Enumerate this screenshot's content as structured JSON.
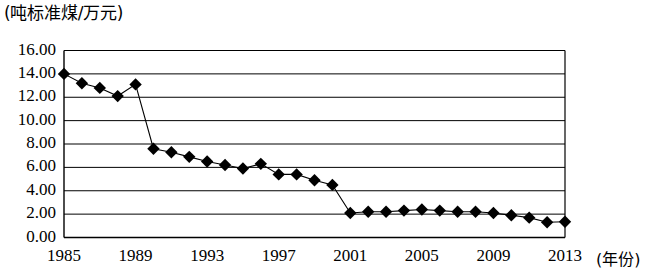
{
  "chart_data": {
    "type": "line",
    "title": "",
    "subtitle": "",
    "ylabel": "(吨标准煤/万元)",
    "xlabel": "(年份)",
    "ylim": [
      0,
      16
    ],
    "ytick_step": 2,
    "grid": true,
    "legend": null,
    "marker": "diamond",
    "marker_color": "#000000",
    "line_color": "#000000",
    "xlim": [
      1985,
      2013
    ],
    "ytick_labels": [
      "16.00",
      "14.00",
      "12.00",
      "10.00",
      "8.00",
      "6.00",
      "4.00",
      "2.00",
      "0.00"
    ],
    "ytick_values": [
      16,
      14,
      12,
      10,
      8,
      6,
      4,
      2,
      0
    ],
    "xtick_labels": [
      "1985",
      "1989",
      "1993",
      "1997",
      "2001",
      "2005",
      "2009",
      "2013"
    ],
    "xtick_values": [
      1985,
      1989,
      1993,
      1997,
      2001,
      2005,
      2009,
      2013
    ],
    "x": [
      1985,
      1986,
      1987,
      1988,
      1989,
      1990,
      1991,
      1992,
      1993,
      1994,
      1995,
      1996,
      1997,
      1998,
      1999,
      2000,
      2001,
      2002,
      2003,
      2004,
      2005,
      2006,
      2007,
      2008,
      2009,
      2010,
      2011,
      2012,
      2013
    ],
    "values": [
      14.0,
      13.2,
      12.8,
      12.1,
      13.1,
      7.6,
      7.3,
      6.9,
      6.5,
      6.2,
      5.9,
      6.3,
      5.4,
      5.4,
      4.9,
      4.5,
      2.1,
      2.2,
      2.2,
      2.3,
      2.4,
      2.3,
      2.2,
      2.2,
      2.1,
      1.9,
      1.7,
      1.3,
      1.35
    ],
    "series": [
      {
        "name": "单位GDP能耗",
        "values": [
          14.0,
          13.2,
          12.8,
          12.1,
          13.1,
          7.6,
          7.3,
          6.9,
          6.5,
          6.2,
          5.9,
          6.3,
          5.4,
          5.4,
          4.9,
          4.5,
          2.1,
          2.2,
          2.2,
          2.3,
          2.4,
          2.3,
          2.2,
          2.2,
          2.1,
          1.9,
          1.7,
          1.3,
          1.35
        ]
      }
    ]
  }
}
